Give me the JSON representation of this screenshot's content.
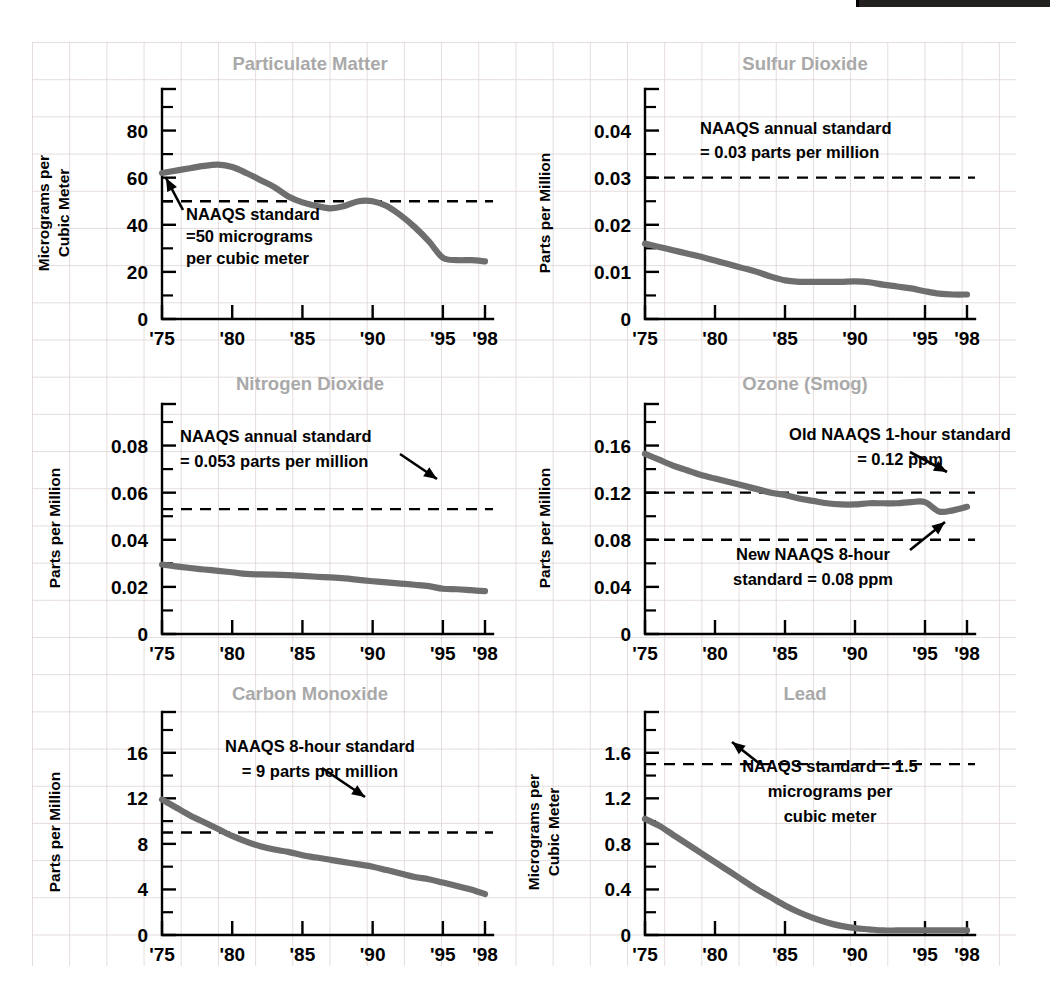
{
  "page": {
    "background_color": "#ffffff",
    "grid_color": "#e1d6d6",
    "series_color": "#6e6e6e",
    "title_color": "#a9a9a9",
    "text_color": "#000000"
  },
  "top_bar": {
    "name": "black-bar-fragment",
    "color": "#23201f"
  },
  "chart_data": [
    {
      "id": "particulate-matter",
      "type": "line",
      "title": "Particulate Matter",
      "ylabel_line1": "Micrograms per",
      "ylabel_line2": "Cubic Meter",
      "xlabel": "",
      "ylim": [
        0,
        90
      ],
      "ytick_labels": [
        "0",
        "20",
        "40",
        "60",
        "80"
      ],
      "ytick_values": [
        0,
        20,
        40,
        60,
        80
      ],
      "yminor_step": 10,
      "xlim": [
        1975,
        1998
      ],
      "xtick_labels": [
        "'75",
        "'80",
        "'85",
        "'90",
        "'95",
        "'98"
      ],
      "xtick_values": [
        1975,
        1980,
        1985,
        1990,
        1995,
        1998
      ],
      "x": [
        1975,
        1976,
        1977,
        1978,
        1979,
        1980,
        1981,
        1982,
        1983,
        1984,
        1985,
        1986,
        1987,
        1988,
        1989,
        1990,
        1991,
        1992,
        1993,
        1994,
        1995,
        1996,
        1997,
        1998
      ],
      "values": [
        62,
        63,
        64,
        65,
        65.5,
        64.5,
        62,
        59,
        56,
        52,
        49.5,
        48,
        47,
        48,
        50,
        50,
        48,
        44,
        39,
        33,
        26,
        25,
        25,
        24.5
      ],
      "standard_value": 50,
      "standard_label_lines": [
        "NAAQS standard",
        "=50 micrograms",
        "per cubic meter"
      ],
      "grid": false,
      "legend": "none"
    },
    {
      "id": "sulfur-dioxide",
      "type": "line",
      "title": "Sulfur Dioxide",
      "ylabel_line1": "Parts per Million",
      "ylabel_line2": "",
      "xlabel": "",
      "ylim": [
        0,
        0.045
      ],
      "ytick_labels": [
        "0",
        "0.01",
        "0.02",
        "0.03",
        "0.04"
      ],
      "ytick_values": [
        0,
        0.01,
        0.02,
        0.03,
        0.04
      ],
      "yminor_step": 0.005,
      "xlim": [
        1975,
        1998
      ],
      "xtick_labels": [
        "'75",
        "'80",
        "'85",
        "'90",
        "'95",
        "'98"
      ],
      "xtick_values": [
        1975,
        1980,
        1985,
        1990,
        1995,
        1998
      ],
      "x": [
        1975,
        1976,
        1977,
        1978,
        1979,
        1980,
        1981,
        1982,
        1983,
        1984,
        1985,
        1986,
        1987,
        1988,
        1989,
        1990,
        1991,
        1992,
        1993,
        1994,
        1995,
        1996,
        1997,
        1998
      ],
      "values": [
        0.016,
        0.0153,
        0.0146,
        0.0139,
        0.0132,
        0.0124,
        0.0116,
        0.0108,
        0.01,
        0.009,
        0.0082,
        0.0079,
        0.0079,
        0.0079,
        0.0079,
        0.008,
        0.0078,
        0.0073,
        0.0069,
        0.0065,
        0.0059,
        0.0054,
        0.0052,
        0.0052
      ],
      "standard_value": 0.03,
      "standard_label_lines": [
        "NAAQS annual standard",
        "= 0.03 parts per million"
      ],
      "grid": false,
      "legend": "none"
    },
    {
      "id": "nitrogen-dioxide",
      "type": "line",
      "title": "Nitrogen Dioxide",
      "ylabel_line1": "Parts per Million",
      "ylabel_line2": "",
      "xlabel": "",
      "ylim": [
        0,
        0.09
      ],
      "ytick_labels": [
        "0",
        "0.02",
        "0.04",
        "0.06",
        "0.08"
      ],
      "ytick_values": [
        0,
        0.02,
        0.04,
        0.06,
        0.08
      ],
      "yminor_step": 0.01,
      "xlim": [
        1975,
        1998
      ],
      "xtick_labels": [
        "'75",
        "'80",
        "'85",
        "'90",
        "'95",
        "'98"
      ],
      "xtick_values": [
        1975,
        1980,
        1985,
        1990,
        1995,
        1998
      ],
      "x": [
        1975,
        1976,
        1977,
        1978,
        1979,
        1980,
        1981,
        1982,
        1983,
        1984,
        1985,
        1986,
        1987,
        1988,
        1989,
        1990,
        1991,
        1992,
        1993,
        1994,
        1995,
        1996,
        1997,
        1998
      ],
      "values": [
        0.0295,
        0.0287,
        0.028,
        0.0274,
        0.0268,
        0.0262,
        0.0255,
        0.0253,
        0.0252,
        0.025,
        0.0247,
        0.0243,
        0.024,
        0.0236,
        0.023,
        0.0224,
        0.0219,
        0.0214,
        0.0209,
        0.0203,
        0.0192,
        0.019,
        0.0186,
        0.0182
      ],
      "standard_value": 0.053,
      "standard_label_lines": [
        "NAAQS annual standard",
        "= 0.053 parts per million"
      ],
      "grid": false,
      "legend": "none"
    },
    {
      "id": "ozone-smog",
      "type": "line",
      "title": "Ozone (Smog)",
      "ylabel_line1": "Parts per Million",
      "ylabel_line2": "",
      "xlabel": "",
      "ylim": [
        0,
        0.18
      ],
      "ytick_labels": [
        "0",
        "0.04",
        "0.08",
        "0.12",
        "0.16"
      ],
      "ytick_values": [
        0,
        0.04,
        0.08,
        0.12,
        0.16
      ],
      "yminor_step": 0.02,
      "xlim": [
        1975,
        1998
      ],
      "xtick_labels": [
        "'75",
        "'80",
        "'85",
        "'90",
        "'95",
        "'98"
      ],
      "xtick_values": [
        1975,
        1980,
        1985,
        1990,
        1995,
        1998
      ],
      "x": [
        1975,
        1976,
        1977,
        1978,
        1979,
        1980,
        1981,
        1982,
        1983,
        1984,
        1985,
        1986,
        1987,
        1988,
        1989,
        1990,
        1991,
        1992,
        1993,
        1994,
        1995,
        1996,
        1997,
        1998
      ],
      "values": [
        0.153,
        0.148,
        0.143,
        0.139,
        0.135,
        0.132,
        0.129,
        0.126,
        0.123,
        0.12,
        0.118,
        0.115,
        0.113,
        0.111,
        0.11,
        0.11,
        0.111,
        0.111,
        0.111,
        0.112,
        0.112,
        0.104,
        0.105,
        0.108
      ],
      "standard_value": 0.12,
      "standard_value_2": 0.08,
      "standard_label_lines": [
        "Old NAAQS 1-hour standard",
        "= 0.12 ppm"
      ],
      "standard_label_2_lines": [
        "New NAAQS 8-hour",
        "standard = 0.08 ppm"
      ],
      "grid": false,
      "legend": "none"
    },
    {
      "id": "carbon-monoxide",
      "type": "line",
      "title": "Carbon Monoxide",
      "ylabel_line1": "Parts per Million",
      "ylabel_line2": "",
      "xlim": [
        1975,
        1998
      ],
      "ylim": [
        0,
        18
      ],
      "ytick_labels": [
        "0",
        "4",
        "8",
        "12",
        "16"
      ],
      "ytick_values": [
        0,
        4,
        8,
        12,
        16
      ],
      "yminor_step": 2,
      "xtick_labels": [
        "'75",
        "'80",
        "'85",
        "'90",
        "'95",
        "'98"
      ],
      "xtick_values": [
        1975,
        1980,
        1985,
        1990,
        1995,
        1998
      ],
      "x": [
        1975,
        1976,
        1977,
        1978,
        1979,
        1980,
        1981,
        1982,
        1983,
        1984,
        1985,
        1986,
        1987,
        1988,
        1989,
        1990,
        1991,
        1992,
        1993,
        1994,
        1995,
        1996,
        1997,
        1998
      ],
      "values": [
        11.9,
        11.2,
        10.5,
        9.9,
        9.3,
        8.7,
        8.2,
        7.8,
        7.5,
        7.3,
        7.0,
        6.8,
        6.6,
        6.4,
        6.2,
        6.0,
        5.7,
        5.4,
        5.1,
        4.9,
        4.6,
        4.3,
        4.0,
        3.6
      ],
      "standard_value": 9,
      "standard_label_lines": [
        "NAAQS 8-hour standard",
        "= 9 parts per million"
      ],
      "grid": false,
      "legend": "none"
    },
    {
      "id": "lead",
      "type": "line",
      "title": "Lead",
      "ylabel_line1": "Micrograms per",
      "ylabel_line2": "Cubic Meter",
      "xlim": [
        1975,
        1998
      ],
      "ylim": [
        0,
        1.8
      ],
      "ytick_labels": [
        "0",
        "0.4",
        "0.8",
        "1.2",
        "1.6"
      ],
      "ytick_values": [
        0,
        0.4,
        0.8,
        1.2,
        1.6
      ],
      "yminor_step": 0.2,
      "xtick_labels": [
        "'75",
        "'80",
        "'85",
        "'90",
        "'95",
        "'98"
      ],
      "xtick_values": [
        1975,
        1980,
        1985,
        1990,
        1995,
        1998
      ],
      "x": [
        1975,
        1976,
        1977,
        1978,
        1979,
        1980,
        1981,
        1982,
        1983,
        1984,
        1985,
        1986,
        1987,
        1988,
        1989,
        1990,
        1991,
        1992,
        1993,
        1994,
        1995,
        1996,
        1997,
        1998
      ],
      "values": [
        1.02,
        0.96,
        0.88,
        0.8,
        0.72,
        0.64,
        0.56,
        0.48,
        0.4,
        0.33,
        0.26,
        0.2,
        0.15,
        0.11,
        0.08,
        0.06,
        0.05,
        0.04,
        0.04,
        0.04,
        0.04,
        0.04,
        0.04,
        0.04
      ],
      "standard_value": 1.5,
      "standard_label_lines": [
        "NAAQS standard = 1.5",
        "micrograms per",
        "cubic meter"
      ],
      "grid": false,
      "legend": "none"
    }
  ]
}
